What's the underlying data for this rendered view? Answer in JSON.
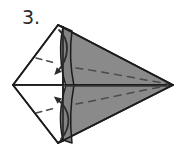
{
  "figure": {
    "kind": "origami-fold-instruction",
    "step_label": "3.",
    "step_number": 3,
    "caption": "",
    "background_color": "#ffffff",
    "ink_color": "#1c1c1c",
    "shaded_fill": "#8a8a8a",
    "shaded_fill_dark": "#6f6f6f",
    "shaded_fill_light": "#9a9a9a",
    "unshaded_fill": "#ffffff",
    "dashed_line_color": "#55555a",
    "arrow_color": "#2b2b2b"
  },
  "geometry": {
    "top_vertex": {
      "x": 58,
      "y": 25
    },
    "left_vertex": {
      "x": 13,
      "y": 85
    },
    "bottom_vertex": {
      "x": 58,
      "y": 143
    },
    "right_tip": {
      "x": 173,
      "y": 85
    },
    "center_fold_x": 63,
    "horizontal_axis_y": 85
  },
  "elements": {
    "step_label_name": "step-number-label",
    "upper_shaded_flap": "upper-shaded-flap",
    "lower_shaded_flap": "lower-shaded-flap",
    "upper_white_flap": "upper-white-flap",
    "lower_white_flap": "lower-white-flap",
    "upper_dashed_fold": "upper-dashed-fold-line",
    "lower_dashed_fold": "lower-dashed-fold-line",
    "upper_left_dashed": "upper-left-dashed-crease",
    "lower_left_dashed": "lower-left-dashed-crease",
    "center_horizontal_line": "center-horizontal-crease",
    "vertical_fold_edge": "vertical-fold-edge",
    "upper_arrow": "upper-fold-arrow",
    "lower_arrow": "lower-fold-arrow",
    "upper_curve_edge": "upper-curved-flap-edge",
    "lower_curve_edge": "lower-curved-flap-edge"
  },
  "annotations": {
    "upper_arrow_direction": "down-left",
    "lower_arrow_direction": "up-left",
    "arrow_meaning": "fold flap toward center"
  }
}
